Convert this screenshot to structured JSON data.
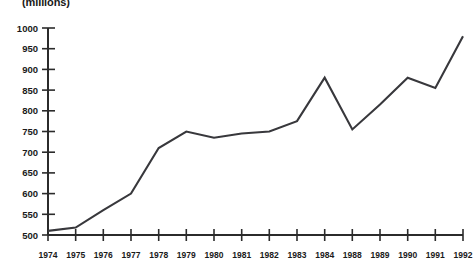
{
  "chart_data": {
    "type": "line",
    "title": "(millions)",
    "title_clipped_note": "top line of title is cut off above the image frame",
    "xlabel": "",
    "ylabel": "",
    "categories": [
      "1974",
      "1975",
      "1976",
      "1977",
      "1978",
      "1979",
      "1980",
      "1981",
      "1982",
      "1983",
      "1984",
      "1988",
      "1989",
      "1990",
      "1991",
      "1992"
    ],
    "values": [
      510,
      518,
      560,
      600,
      710,
      750,
      735,
      745,
      750,
      775,
      880,
      755,
      815,
      880,
      855,
      980
    ],
    "series": [
      {
        "name": "series-1",
        "values": [
          510,
          518,
          560,
          600,
          710,
          750,
          735,
          745,
          750,
          775,
          880,
          755,
          815,
          880,
          855,
          980
        ]
      }
    ],
    "ylim": [
      500,
      1000
    ],
    "ytick_step": 50,
    "yticks": [
      "1000",
      "950",
      "900",
      "850",
      "800",
      "750",
      "700",
      "650",
      "600",
      "550",
      "500"
    ],
    "grid": false,
    "legend": null,
    "line_color": "#38383c",
    "axis_color": "#2b2b2b",
    "text_color": "#1a1a1a",
    "background": "#ffffff"
  }
}
